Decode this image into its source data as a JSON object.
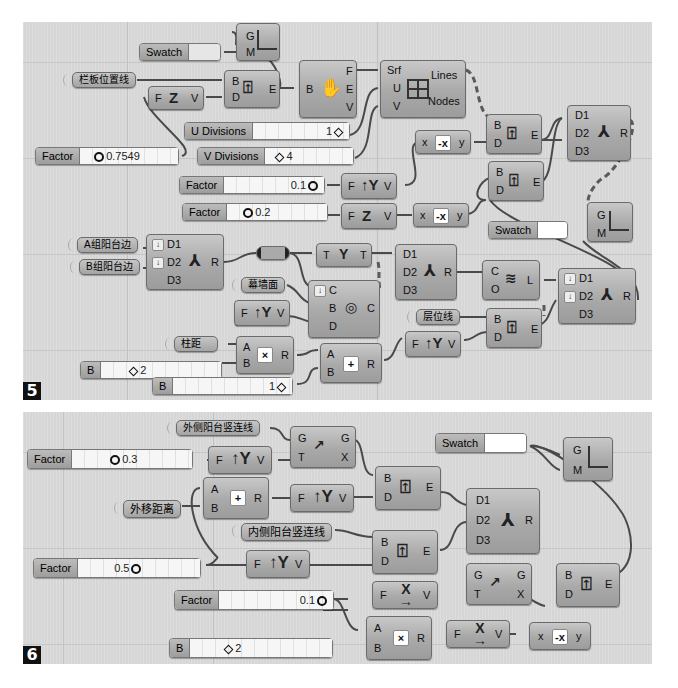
{
  "panels": [
    {
      "number": "5"
    },
    {
      "number": "6"
    }
  ],
  "panel5": {
    "swatch_top": {
      "label": "Swatch"
    },
    "preview_top": {
      "g": "G",
      "m": "M"
    },
    "param_lanban": "栏板位置线",
    "deconstruct_brep": {
      "in_b": "B",
      "out_f": "F",
      "out_e": "E",
      "out_v": "V"
    },
    "evaluate_top": {
      "b": "B",
      "d": "D",
      "e": "E"
    },
    "vec_z_top": {
      "f": "F",
      "v": "V",
      "icon": "Z"
    },
    "isotrim": {
      "srf": "Srf",
      "u": "U",
      "v": "V",
      "lines": "Lines",
      "nodes": "Nodes"
    },
    "u_divisions": {
      "label": "U Divisions",
      "value": "1"
    },
    "v_divisions": {
      "label": "V Divisions",
      "value": "4"
    },
    "factor_0754": {
      "label": "Factor",
      "value": "0.7549"
    },
    "factor_01": {
      "label": "Factor",
      "value": "0.1"
    },
    "factor_02": {
      "label": "Factor",
      "value": "0.2"
    },
    "vec_y_1": {
      "f": "F",
      "v": "V",
      "icon": "Y"
    },
    "vec_z_2": {
      "f": "F",
      "v": "V",
      "icon": "Z"
    },
    "negate_1": {
      "x": "x",
      "y": "y",
      "icon": "-x"
    },
    "negate_2": {
      "x": "x",
      "y": "y",
      "icon": "-x"
    },
    "evaluate_r1": {
      "b": "B",
      "d": "D",
      "e": "E"
    },
    "evaluate_r2": {
      "b": "B",
      "d": "D",
      "e": "E"
    },
    "merge_top": {
      "d1": "D1",
      "d2": "D2",
      "d3": "D3",
      "r": "R"
    },
    "swatch_mid": {
      "label": "Swatch"
    },
    "preview_mid": {
      "g": "G",
      "m": "M"
    },
    "param_a": "A组阳台边",
    "param_b": "B组阳台边",
    "merge_left": {
      "d1": "D1",
      "d2": "D2",
      "d3": "D3",
      "r": "R"
    },
    "tree_node": {
      "t_in": "T",
      "t_out": "T"
    },
    "merge_mid": {
      "d1": "D1",
      "d2": "D2",
      "d3": "D3",
      "r": "R"
    },
    "polyline": {
      "c": "C",
      "o": "O",
      "l": "L"
    },
    "merge_right": {
      "d1": "D1",
      "d2": "D2",
      "d3": "D3",
      "r": "R"
    },
    "param_mqm": "幕墙面",
    "vec_y_2": {
      "f": "F",
      "v": "V",
      "icon": "Y"
    },
    "brep_curve": {
      "c": "C",
      "b": "B",
      "d": "D",
      "out": "C"
    },
    "param_cwx": "层位线",
    "evaluate_r3": {
      "b": "B",
      "d": "D",
      "e": "E"
    },
    "param_zj": "柱距",
    "multiply": {
      "a": "A",
      "b": "B",
      "r": "R",
      "icon": "×"
    },
    "addition": {
      "a": "A",
      "b": "B",
      "r": "R",
      "icon": "+"
    },
    "vec_y_3": {
      "f": "F",
      "v": "V",
      "icon": "Y"
    },
    "slider_b2": {
      "label": "B",
      "value": "2"
    },
    "slider_b1": {
      "label": "B",
      "value": "1"
    }
  },
  "panel6": {
    "param_outer": "外侧阳台竖连线",
    "param_offset": "外移距离",
    "param_inner": "内侧阳台竖连线",
    "factor_03": {
      "label": "Factor",
      "value": "0.3"
    },
    "factor_05": {
      "label": "Factor",
      "value": "0.5"
    },
    "factor_01": {
      "label": "Factor",
      "value": "0.1"
    },
    "slider_b2": {
      "label": "B",
      "value": "2"
    },
    "vec_y_1": {
      "f": "F",
      "v": "V",
      "icon": "Y"
    },
    "vec_y_2": {
      "f": "F",
      "v": "V",
      "icon": "Y"
    },
    "vec_y_3": {
      "f": "F",
      "v": "V",
      "icon": "Y"
    },
    "move_1": {
      "g": "G",
      "t": "T",
      "g_out": "G",
      "x": "X"
    },
    "move_2": {
      "g": "G",
      "t": "T",
      "g_out": "G",
      "x": "X"
    },
    "addition": {
      "a": "A",
      "b": "B",
      "r": "R",
      "icon": "+"
    },
    "multiply": {
      "a": "A",
      "b": "B",
      "r": "R",
      "icon": "×"
    },
    "evaluate_1": {
      "b": "B",
      "d": "D",
      "e": "E"
    },
    "evaluate_2": {
      "b": "B",
      "d": "D",
      "e": "E"
    },
    "evaluate_3": {
      "b": "B",
      "d": "D",
      "e": "E"
    },
    "merge": {
      "d1": "D1",
      "d2": "D2",
      "d3": "D3",
      "r": "R"
    },
    "vec_x_1": {
      "f": "F",
      "v": "V",
      "icon": "X"
    },
    "vec_x_2": {
      "f": "F",
      "v": "V",
      "icon": "X"
    },
    "negate": {
      "x": "x",
      "y": "y",
      "icon": "-x"
    },
    "swatch": {
      "label": "Swatch"
    },
    "preview": {
      "g": "G",
      "m": "M"
    }
  }
}
